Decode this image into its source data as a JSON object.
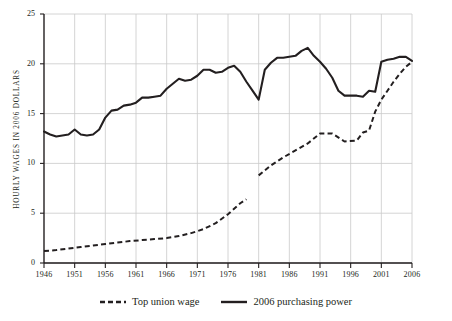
{
  "chart_data": {
    "type": "line",
    "title": "",
    "subtitle": "",
    "xlabel": "",
    "ylabel": "Hourly wages in 2006 dollars",
    "xlim": [
      1946,
      2006
    ],
    "ylim": [
      0,
      25
    ],
    "ytick_values": [
      0,
      5,
      10,
      15,
      20,
      25
    ],
    "ytick_labels": [
      "0",
      "5",
      "10",
      "15",
      "20",
      "25"
    ],
    "xtick_values": [
      1946,
      1951,
      1956,
      1961,
      1966,
      1971,
      1976,
      1981,
      1986,
      1991,
      1996,
      2001,
      2006
    ],
    "xtick_labels": [
      "1946",
      "1951",
      "1956",
      "1961",
      "1966",
      "1971",
      "1976",
      "1981",
      "1986",
      "1991",
      "1996",
      "2001",
      "2006"
    ],
    "grid": true,
    "grid_color": "#c9c9c9",
    "legend_position": "bottom-center",
    "series": [
      {
        "name": "Top union wage",
        "style": "dashed",
        "color": "#231f20",
        "x": [
          1946,
          1948,
          1950,
          1952,
          1954,
          1956,
          1958,
          1960,
          1962,
          1964,
          1966,
          1968,
          1970,
          1972,
          1974,
          1976,
          1978,
          1979
        ],
        "values": [
          1.2,
          1.3,
          1.45,
          1.6,
          1.75,
          1.9,
          2.05,
          2.2,
          2.3,
          2.4,
          2.5,
          2.7,
          3.0,
          3.4,
          4.0,
          4.9,
          6.0,
          6.4
        ]
      },
      {
        "name": "Top union wage",
        "style": "dashed",
        "color": "#231f20",
        "segment": 2,
        "x": [
          1981,
          1983,
          1985,
          1987,
          1989,
          1991,
          1993,
          1995,
          1997,
          1998,
          1999,
          2000,
          2001,
          2002,
          2003,
          2004,
          2005,
          2006
        ],
        "values": [
          8.8,
          9.8,
          10.6,
          11.3,
          12.0,
          13.0,
          13.0,
          12.2,
          12.3,
          13.1,
          13.3,
          15.2,
          16.4,
          17.3,
          18.2,
          19.0,
          19.7,
          20.2
        ]
      },
      {
        "name": "2006 purchasing power",
        "style": "solid",
        "color": "#231f20",
        "x": [
          1946,
          1947,
          1948,
          1949,
          1950,
          1951,
          1952,
          1953,
          1954,
          1955,
          1956,
          1957,
          1958,
          1959,
          1960,
          1961,
          1962,
          1963,
          1964,
          1965,
          1966,
          1967,
          1968,
          1969,
          1970,
          1971,
          1972,
          1973,
          1974,
          1975,
          1976,
          1977,
          1978,
          1979,
          1980,
          1981,
          1982,
          1983,
          1984,
          1985,
          1986,
          1987,
          1988,
          1989,
          1990,
          1991,
          1992,
          1993,
          1994,
          1995,
          1996,
          1997,
          1998,
          1999,
          2000,
          2001,
          2002,
          2003,
          2004,
          2005,
          2006
        ],
        "values": [
          13.2,
          12.9,
          12.7,
          12.8,
          12.9,
          13.4,
          12.9,
          12.8,
          12.9,
          13.4,
          14.6,
          15.3,
          15.4,
          15.8,
          15.9,
          16.1,
          16.6,
          16.6,
          16.7,
          16.8,
          17.5,
          18.0,
          18.5,
          18.3,
          18.4,
          18.8,
          19.4,
          19.4,
          19.1,
          19.2,
          19.6,
          19.8,
          19.2,
          18.2,
          17.3,
          16.4,
          19.4,
          20.1,
          20.6,
          20.6,
          20.7,
          20.8,
          21.3,
          21.6,
          20.8,
          20.2,
          19.5,
          18.6,
          17.3,
          16.8,
          16.8,
          16.8,
          16.7,
          17.3,
          17.2,
          20.2,
          20.4,
          20.5,
          20.7,
          20.7,
          20.3
        ]
      }
    ]
  },
  "legend": {
    "items": [
      {
        "label": "Top union wage",
        "style": "dashed"
      },
      {
        "label": "2006 purchasing power",
        "style": "solid"
      }
    ]
  }
}
